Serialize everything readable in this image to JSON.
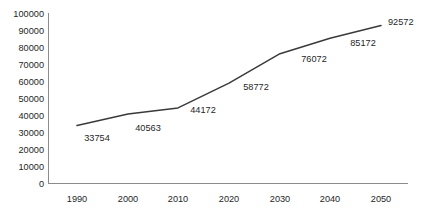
{
  "chart_data": {
    "type": "line",
    "title": "",
    "subtitle": "",
    "xlabel": "",
    "ylabel": "",
    "categories": [
      "1990",
      "2000",
      "2010",
      "2020",
      "2030",
      "2040",
      "2050"
    ],
    "x": [
      1990,
      2000,
      2010,
      2020,
      2030,
      2040,
      2050
    ],
    "values": [
      33754,
      40563,
      44172,
      58772,
      76072,
      85172,
      92572
    ],
    "series": [
      {
        "name": "",
        "color": "#3a3a3a",
        "values": [
          33754,
          40563,
          44172,
          58772,
          76072,
          85172,
          92572
        ]
      }
    ],
    "point_labels": [
      "33754",
      "40563",
      "44172",
      "58772",
      "76072",
      "85172",
      "92572"
    ],
    "ylim": [
      0,
      100000
    ],
    "ytick_values": [
      0,
      10000,
      20000,
      30000,
      40000,
      50000,
      60000,
      70000,
      80000,
      90000,
      100000
    ],
    "ytick_labels": [
      "0",
      "10000",
      "20000",
      "30000",
      "40000",
      "50000",
      "60000",
      "70000",
      "80000",
      "90000",
      "100000"
    ],
    "xtick_labels": [
      "1990",
      "2000",
      "2010",
      "2020",
      "2030",
      "2040",
      "2050"
    ],
    "grid": false,
    "legend": false,
    "legend_position": "none",
    "markers": false,
    "axis_color": "#8c8c8c",
    "background_color": "#ffffff"
  },
  "geometry": {
    "plot_left": 48,
    "plot_right": 408,
    "plot_top": 13,
    "plot_bottom": 183,
    "x_positions": [
      77,
      128,
      178,
      229,
      280,
      330,
      381
    ],
    "label_positions": [
      {
        "x": 97,
        "y": 141
      },
      {
        "x": 148,
        "y": 131
      },
      {
        "x": 203,
        "y": 113
      },
      {
        "x": 256,
        "y": 90
      },
      {
        "x": 314,
        "y": 62
      },
      {
        "x": 363,
        "y": 46
      },
      {
        "x": 388,
        "y": 25
      }
    ]
  }
}
